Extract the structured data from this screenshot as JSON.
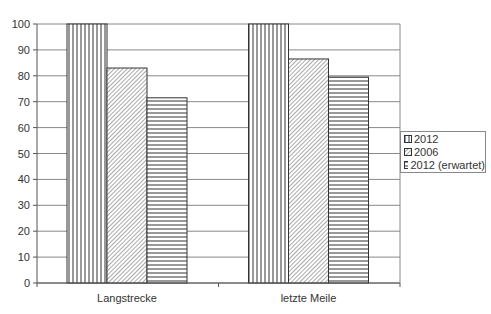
{
  "chart_data": {
    "type": "bar",
    "title": "",
    "xlabel": "",
    "ylabel": "",
    "ylim": [
      0,
      100
    ],
    "yticks": [
      0,
      10,
      20,
      30,
      40,
      50,
      60,
      70,
      80,
      90,
      100
    ],
    "grid": true,
    "legend_position": "right",
    "categories": [
      "Langstrecke",
      "letzte Meile"
    ],
    "series": [
      {
        "name": "2012",
        "pattern": "vertical-lines",
        "values": [
          100,
          100
        ]
      },
      {
        "name": "2006",
        "pattern": "diagonal-hatch",
        "values": [
          83,
          86.5
        ]
      },
      {
        "name": "2012 (erwartet)",
        "pattern": "horizontal-lines",
        "values": [
          71.5,
          79.5
        ]
      }
    ]
  },
  "legend": {
    "items": [
      {
        "label": "2012"
      },
      {
        "label": "2006"
      },
      {
        "label": "2012 (erwartet)"
      }
    ]
  },
  "colors": {
    "line": "#333333",
    "grid": "#888888",
    "background": "#ffffff"
  }
}
